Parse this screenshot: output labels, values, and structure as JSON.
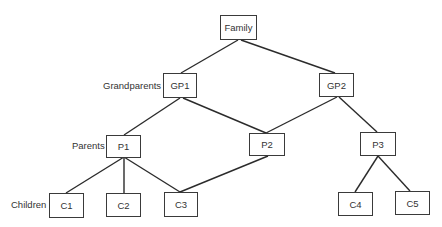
{
  "diagram": {
    "type": "family-tree",
    "levels": [
      {
        "id": "grandparents",
        "label": "Grandparents"
      },
      {
        "id": "parents",
        "label": "Parents"
      },
      {
        "id": "children",
        "label": "Children"
      }
    ],
    "nodes": {
      "family": {
        "label": "Family"
      },
      "gp1": {
        "label": "GP1"
      },
      "gp2": {
        "label": "GP2"
      },
      "p1": {
        "label": "P1"
      },
      "p2": {
        "label": "P2"
      },
      "p3": {
        "label": "P3"
      },
      "c1": {
        "label": "C1"
      },
      "c2": {
        "label": "C2"
      },
      "c3": {
        "label": "C3"
      },
      "c4": {
        "label": "C4"
      },
      "c5": {
        "label": "C5"
      }
    },
    "edges": [
      [
        "Family",
        "GP1"
      ],
      [
        "Family",
        "GP2"
      ],
      [
        "GP1",
        "P1"
      ],
      [
        "GP1",
        "P2"
      ],
      [
        "GP2",
        "P2"
      ],
      [
        "GP2",
        "P3"
      ],
      [
        "P1",
        "C1"
      ],
      [
        "P1",
        "C2"
      ],
      [
        "P1",
        "C3"
      ],
      [
        "P2",
        "C3"
      ],
      [
        "P3",
        "C4"
      ],
      [
        "P3",
        "C5"
      ]
    ]
  }
}
